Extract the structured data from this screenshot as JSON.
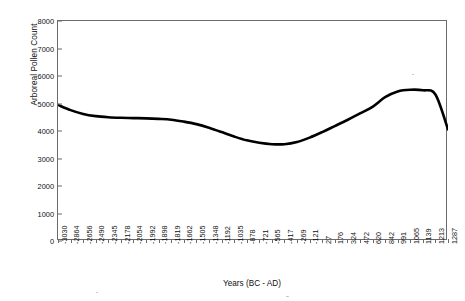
{
  "chart_data": {
    "type": "line",
    "title": "",
    "xlabel": "Years (BC - AD)",
    "ylabel": "Arboreal Pollen Count",
    "ylim": [
      0,
      8000
    ],
    "y_ticks": [
      0,
      1000,
      2000,
      3000,
      4000,
      5000,
      6000,
      7000,
      8000
    ],
    "grid": false,
    "legend": "none",
    "categories": [
      "-3030",
      "-2864",
      "-2656",
      "-2490",
      "-2345",
      "-2178",
      "-2054",
      "-1992",
      "-1898",
      "-1819",
      "-1662",
      "-1505",
      "-1348",
      "-1192",
      "-1035",
      "-878",
      "-721",
      "-565",
      "-417",
      "-269",
      "-121",
      "27",
      "176",
      "324",
      "472",
      "620",
      "842",
      "991",
      "1065",
      "1139",
      "1213",
      "1287"
    ],
    "series": [
      {
        "name": "Arboreal Pollen Count",
        "values": [
          4950,
          4760,
          4620,
          4540,
          4500,
          4480,
          4470,
          4460,
          4440,
          4410,
          4340,
          4250,
          4120,
          3960,
          3800,
          3660,
          3570,
          3520,
          3520,
          3600,
          3760,
          3960,
          4180,
          4400,
          4640,
          4880,
          5230,
          5440,
          5500,
          5480,
          5330,
          4060
        ]
      }
    ]
  },
  "axes": {
    "y_title": "Arboreal Pollen Count",
    "x_title": "Years (BC - AD)"
  }
}
